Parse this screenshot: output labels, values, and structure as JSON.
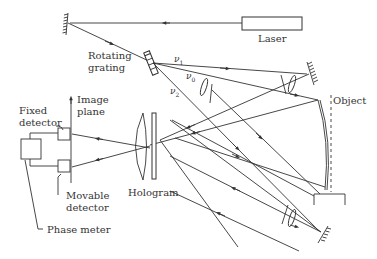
{
  "diagram": {
    "type": "optical-setup",
    "labels": {
      "laser": "Laser",
      "rotating_grating_line1": "Rotating",
      "rotating_grating_line2": "grating",
      "nu1": "ν",
      "nu1_sub": "1",
      "nu0": "ν",
      "nu0_sub": "0",
      "nu2": "ν",
      "nu2_sub": "2",
      "object": "Object",
      "image_plane_line1": "Image",
      "image_plane_line2": "plane",
      "fixed_detector_line1": "Fixed",
      "fixed_detector_line2": "detector",
      "movable_detector_line1": "Movable",
      "movable_detector_line2": "detector",
      "hologram": "Hologram",
      "phase_meter": "Phase meter"
    },
    "components": [
      "laser",
      "mirror-top-left",
      "rotating-grating",
      "mirror-right",
      "mirror-bottom-right",
      "lens-pairs",
      "object",
      "object-mount",
      "hologram-plate",
      "imaging-lens",
      "fixed-detector",
      "movable-detector",
      "phase-meter"
    ],
    "colors": {
      "stroke": "#333333",
      "background": "#ffffff"
    }
  }
}
